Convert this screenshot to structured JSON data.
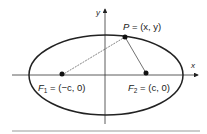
{
  "diagram": {
    "axes": {
      "x_label": "x",
      "y_label": "y"
    },
    "point_p": {
      "name": "P",
      "label": "P = (x, y)",
      "eq": " = (x, y)"
    },
    "focus_1": {
      "name": "F",
      "sub": "1",
      "label": "F1 = (−c, 0)",
      "eq": " = (−c, 0)"
    },
    "focus_2": {
      "name": "F",
      "sub": "2",
      "label": "F2 = (c, 0)",
      "eq": " = (c, 0)"
    },
    "colors": {
      "stroke": "#222222",
      "divider": "#888888"
    }
  }
}
